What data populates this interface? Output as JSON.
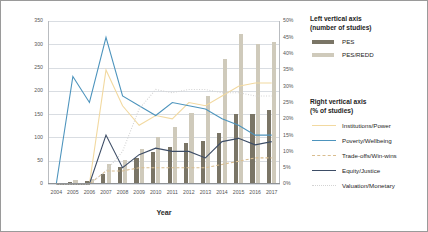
{
  "chart_data": {
    "type": "bar",
    "title": "",
    "xlabel": "Year",
    "categories": [
      "2004",
      "2005",
      "2006",
      "2007",
      "2008",
      "2009",
      "2010",
      "2011",
      "2012",
      "2013",
      "2014",
      "2015",
      "2016",
      "2017"
    ],
    "left_axis": {
      "label": "number of studies",
      "ylim": [
        0,
        350
      ],
      "ticks": [
        "0",
        "50",
        "100",
        "150",
        "200",
        "250",
        "300",
        "350"
      ],
      "tickvals": [
        0,
        50,
        100,
        150,
        200,
        250,
        300,
        350
      ]
    },
    "right_axis": {
      "label": "% of studies",
      "ylim": [
        0,
        50
      ],
      "ticks": [
        "0%",
        "5%",
        "10%",
        "15%",
        "20%",
        "25%",
        "30%",
        "35%",
        "40%",
        "45%",
        "50%"
      ],
      "tickvals": [
        0,
        5,
        10,
        15,
        20,
        25,
        30,
        35,
        40,
        45,
        50
      ]
    },
    "grid": true,
    "legend_position": "right",
    "bar_series": [
      {
        "name": "PES",
        "color": "#7a7566",
        "axis": "left",
        "values": [
          0,
          4,
          6,
          22,
          37,
          55,
          68,
          80,
          88,
          92,
          110,
          150,
          150,
          160
        ]
      },
      {
        "name": "PES/REDD",
        "color": "#cfcabb",
        "axis": "left",
        "values": [
          0,
          8,
          10,
          42,
          52,
          75,
          100,
          122,
          152,
          190,
          268,
          322,
          300,
          305
        ]
      }
    ],
    "line_series": [
      {
        "name": "Institutions/Power",
        "color": "#f2d9a0",
        "style": "solid",
        "axis": "right",
        "values": [
          0,
          0,
          0,
          35,
          24,
          18,
          21,
          20,
          25,
          24,
          27,
          30,
          31,
          31
        ]
      },
      {
        "name": "Poverty/Wellbeing",
        "color": "#4d94bd",
        "style": "solid",
        "axis": "right",
        "values": [
          0,
          33,
          25,
          45,
          27,
          24,
          21,
          25,
          24,
          23,
          20,
          18,
          15,
          15
        ]
      },
      {
        "name": "Trade-offs/Win-wins",
        "color": "#d9bd8f",
        "style": "dashed",
        "axis": "right",
        "values": [
          0,
          0,
          0,
          4,
          4,
          5,
          5,
          5,
          5,
          5,
          6,
          7,
          8,
          8
        ]
      },
      {
        "name": "Equity/Justice",
        "color": "#3d4d66",
        "style": "solid",
        "axis": "right",
        "values": [
          0,
          0,
          0,
          15,
          5,
          9,
          11,
          10,
          10,
          8,
          13,
          14,
          12,
          13
        ]
      },
      {
        "name": "Valuation/Monetary",
        "color": "#d3d3d3",
        "style": "dotted",
        "axis": "right",
        "values": [
          0,
          0,
          0,
          4,
          10,
          23,
          29,
          28,
          29,
          29,
          28,
          28,
          27,
          27
        ]
      }
    ]
  },
  "legend": {
    "left_heading_line1": "Left vertical axis",
    "left_heading_line2": "(number of studies)",
    "right_heading_line1": "Right vertical axis",
    "right_heading_line2": "(% of studies)",
    "bar_items": [
      {
        "label": "PES"
      },
      {
        "label": "PES/REDD"
      }
    ],
    "line_items": [
      {
        "label": "Institutions/Power"
      },
      {
        "label": "Poverty/Wellbeing"
      },
      {
        "label": "Trade-offs/Win-wins"
      },
      {
        "label": "Equity/Justice"
      },
      {
        "label": "Valuation/Monetary"
      }
    ]
  }
}
